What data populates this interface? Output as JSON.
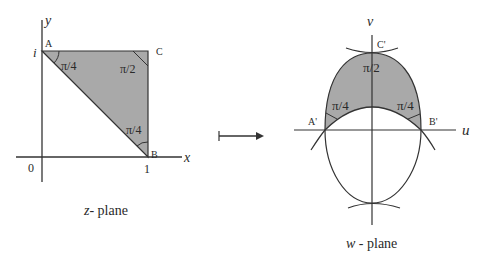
{
  "z_plane": {
    "caption_var": "z",
    "caption_text": "- plane",
    "axis_x_label": "x",
    "axis_y_label": "y",
    "origin_label": "0",
    "tick_x_label": "1",
    "tick_y_label": "i",
    "vertices": {
      "A": "A",
      "B": "B",
      "C": "C"
    },
    "angles": {
      "at_A": "π/4",
      "at_C": "π/2",
      "at_B": "π/4"
    }
  },
  "arrow": {
    "symbol": "maps-to"
  },
  "w_plane": {
    "caption_var": "w",
    "caption_text": " - plane",
    "axis_u_label": "u",
    "axis_v_label": "v",
    "vertices": {
      "A": "A'",
      "B": "B'",
      "C": "C'"
    },
    "angles": {
      "at_C": "π/2",
      "at_A": "π/4",
      "at_B": "π/4"
    }
  },
  "colors": {
    "shade": "#a9a9a9",
    "stroke": "#333333",
    "background": "#ffffff"
  }
}
